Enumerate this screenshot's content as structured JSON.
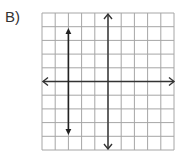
{
  "question": {
    "label": "B)"
  },
  "graph": {
    "grid": {
      "columns": 10,
      "rows": 10,
      "color": "#9a9a9a"
    },
    "x_axis": {
      "arrows": "open-both-ends",
      "color": "#333333"
    },
    "y_axis": {
      "arrows": "open-both-ends",
      "color": "#333333"
    },
    "plotted_line": {
      "type": "vertical",
      "equation": "x = -3",
      "x_position_units": -3,
      "y_extent_units": [
        -4,
        4
      ],
      "arrows": "solid-both-ends",
      "color": "#222222"
    }
  }
}
